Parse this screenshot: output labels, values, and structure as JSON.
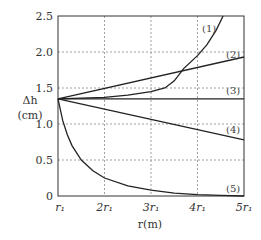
{
  "chart_data": {
    "type": "line",
    "title": "",
    "xlabel": "r(m)",
    "ylabel": "Δh (cm)",
    "ylabel_line1": "Δh",
    "ylabel_line2": "(cm)",
    "xlim": [
      1,
      5
    ],
    "ylim": [
      0,
      2.5
    ],
    "grid": true,
    "x_tick_labels": [
      "r₁",
      "2r₁",
      "3r₁",
      "4r₁",
      "5r₁"
    ],
    "x_tick_values": [
      1,
      2,
      3,
      4,
      5
    ],
    "y_tick_labels": [
      "0",
      "0.5",
      "1.0",
      "1.5",
      "2.0",
      "2.5"
    ],
    "y_tick_values": [
      0,
      0.5,
      1.0,
      1.5,
      2.0,
      2.5
    ],
    "legend": "inline labels at right end of each curve",
    "series": [
      {
        "name": "(1)",
        "label": "(1)",
        "x": [
          1,
          1.5,
          2,
          2.5,
          3,
          3.3,
          3.5,
          3.7,
          4,
          4.2,
          4.4,
          4.55
        ],
        "values": [
          1.35,
          1.36,
          1.37,
          1.4,
          1.45,
          1.5,
          1.6,
          1.77,
          1.95,
          2.1,
          2.3,
          2.5
        ]
      },
      {
        "name": "(2)",
        "label": "(2)",
        "x": [
          1,
          5
        ],
        "values": [
          1.35,
          1.93
        ]
      },
      {
        "name": "(3)",
        "label": "(3)",
        "x": [
          1,
          5
        ],
        "values": [
          1.35,
          1.35
        ]
      },
      {
        "name": "(4)",
        "label": "(4)",
        "x": [
          1,
          5
        ],
        "values": [
          1.35,
          0.78
        ]
      },
      {
        "name": "(5)",
        "label": "(5)",
        "x": [
          1,
          1.1,
          1.2,
          1.3,
          1.5,
          1.75,
          2,
          2.5,
          3,
          3.5,
          4,
          4.5,
          5
        ],
        "values": [
          1.35,
          1.05,
          0.85,
          0.7,
          0.5,
          0.35,
          0.25,
          0.14,
          0.08,
          0.04,
          0.02,
          0.01,
          0.0
        ]
      }
    ]
  }
}
